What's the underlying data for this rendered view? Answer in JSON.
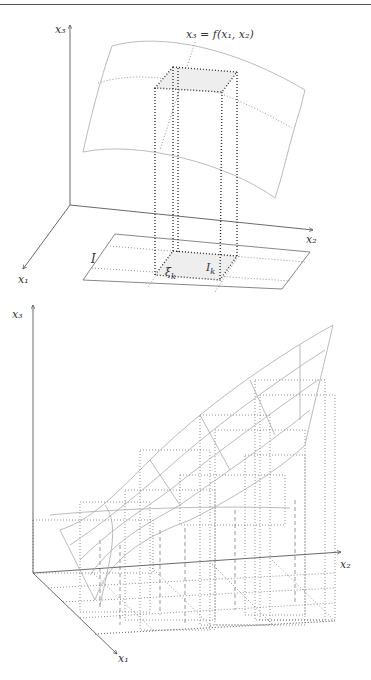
{
  "figure_top": {
    "axis_labels": {
      "x3": "x₃",
      "x2": "x₂",
      "x1": "x₁"
    },
    "surface_label": "x₃ = f(x₁, x₂)",
    "domain_label": "I",
    "cell_label": "I",
    "cell_label_sub": "k",
    "point_label": "ξ",
    "point_label_sub": "k"
  },
  "figure_bottom": {
    "axis_labels": {
      "x3": "x₃",
      "x2": "x₂",
      "x1": "x₁"
    }
  },
  "colors": {
    "axis": "#444444",
    "surface": "#aaaaaa",
    "dotted": "#333333",
    "cell_fill": "#eeeeee"
  }
}
